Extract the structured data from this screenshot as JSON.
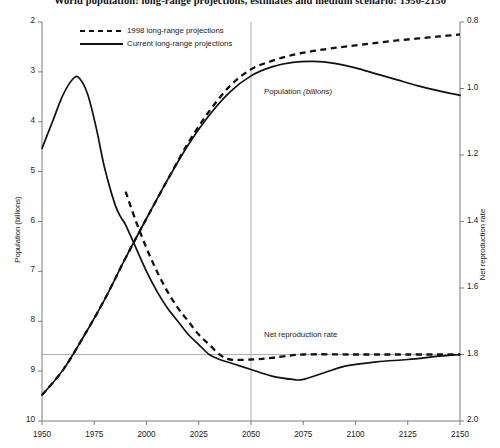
{
  "chart_data": {
    "type": "line",
    "title": "World population: long-range projections, estimates and medium scenario: 1950-2150",
    "xlabel": "",
    "ylabel": "Population (billions)",
    "y2label": "Net reproduction rate",
    "xlim": [
      1950,
      2150
    ],
    "ylim": [
      2,
      10
    ],
    "y2lim": [
      0.8,
      2.0
    ],
    "xticks": [
      1950,
      1975,
      2000,
      2025,
      2050,
      2075,
      2100,
      2125,
      2150
    ],
    "yticks": [
      2,
      3,
      4,
      5,
      6,
      7,
      8,
      9,
      10
    ],
    "y2ticks": [
      0.8,
      1.0,
      1.2,
      1.4,
      1.6,
      1.8,
      2.0
    ],
    "grid": false,
    "legend_position": "top-left",
    "reference_lines": [
      {
        "name": "nrr-replacement-level",
        "orientation": "horizontal",
        "axis": "right",
        "value": 1.0
      },
      {
        "name": "year-2050-marker",
        "orientation": "vertical",
        "axis": "x",
        "value": 2050
      }
    ],
    "annotations": [
      {
        "name": "population-label",
        "text": "Population (billions)",
        "x": 2055,
        "y": 8.35
      },
      {
        "name": "nrr-label",
        "text": "Net reproduction rate",
        "x": 2055,
        "y": 3.55
      }
    ],
    "series": [
      {
        "name": "1998 long-range projections",
        "measure": "Population (billions)",
        "axis": "left",
        "style": "dashed",
        "x": [
          1950,
          1960,
          1970,
          1980,
          1990,
          2000,
          2010,
          2020,
          2030,
          2040,
          2050,
          2060,
          2070,
          2080,
          2090,
          2100,
          2110,
          2120,
          2130,
          2140,
          2150
        ],
        "values": [
          2.52,
          3.02,
          3.7,
          4.44,
          5.27,
          6.06,
          6.83,
          7.58,
          8.21,
          8.72,
          9.05,
          9.22,
          9.34,
          9.42,
          9.48,
          9.53,
          9.58,
          9.63,
          9.67,
          9.71,
          9.75
        ]
      },
      {
        "name": "Current long-range projections",
        "measure": "Population (billions)",
        "axis": "left",
        "style": "solid",
        "x": [
          1950,
          1960,
          1970,
          1980,
          1990,
          2000,
          2010,
          2020,
          2030,
          2040,
          2050,
          2060,
          2070,
          2080,
          2090,
          2100,
          2110,
          2120,
          2130,
          2140,
          2150
        ],
        "values": [
          2.52,
          3.02,
          3.7,
          4.44,
          5.27,
          6.06,
          6.83,
          7.54,
          8.13,
          8.6,
          8.92,
          9.1,
          9.19,
          9.21,
          9.17,
          9.08,
          8.96,
          8.84,
          8.72,
          8.62,
          8.53
        ]
      },
      {
        "name": "1998 long-range projections",
        "measure": "Net reproduction rate",
        "axis": "right",
        "style": "dashed",
        "x": [
          1990,
          1995,
          2000,
          2005,
          2010,
          2015,
          2020,
          2025,
          2030,
          2035,
          2040,
          2050,
          2060,
          2075,
          2100,
          2125,
          2150
        ],
        "values": [
          1.49,
          1.4,
          1.32,
          1.25,
          1.19,
          1.14,
          1.1,
          1.06,
          1.03,
          1.0,
          0.985,
          0.985,
          0.99,
          1.0,
          1.0,
          1.0,
          1.0
        ]
      },
      {
        "name": "Current long-range projections",
        "measure": "Net reproduction rate",
        "axis": "right",
        "style": "solid",
        "x": [
          1950,
          1955,
          1960,
          1965,
          1968,
          1972,
          1976,
          1980,
          1985,
          1988,
          1990,
          1995,
          2000,
          2005,
          2010,
          2015,
          2020,
          2025,
          2030,
          2035,
          2040,
          2045,
          2050,
          2060,
          2070,
          2075,
          2085,
          2095,
          2110,
          2125,
          2140,
          2150
        ],
        "values": [
          1.62,
          1.7,
          1.78,
          1.83,
          1.83,
          1.78,
          1.68,
          1.56,
          1.45,
          1.41,
          1.39,
          1.32,
          1.25,
          1.19,
          1.14,
          1.1,
          1.06,
          1.03,
          1.0,
          0.985,
          0.975,
          0.965,
          0.955,
          0.935,
          0.925,
          0.925,
          0.945,
          0.965,
          0.978,
          0.985,
          0.995,
          1.0
        ]
      }
    ]
  },
  "legend": {
    "entries": [
      {
        "label": "1998 long-range projections",
        "style": "dashed"
      },
      {
        "label": "Current long-range projections",
        "style": "solid"
      }
    ]
  },
  "axes": {
    "left_title": "Population (billions)",
    "right_title": "Net reproduction rate",
    "left_ticks": [
      "10",
      "9",
      "8",
      "7",
      "6",
      "5",
      "4",
      "3",
      "2"
    ],
    "right_ticks": [
      "2.0",
      "1.8",
      "1.6",
      "1.4",
      "1.2",
      "1.0",
      "0.8"
    ],
    "bottom_ticks": [
      "1950",
      "1975",
      "2000",
      "2025",
      "2050",
      "2075",
      "2100",
      "2125",
      "2150"
    ]
  },
  "annotations": {
    "population_main": "Population",
    "population_unit": "(billions)",
    "nrr": "Net reproduction rate"
  }
}
